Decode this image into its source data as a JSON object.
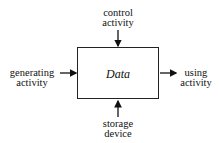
{
  "diagram": {
    "box_label": "Data",
    "inputs": {
      "top": [
        "control",
        "activity"
      ],
      "left": [
        "generating",
        "activity"
      ],
      "right": [
        "using",
        "activity"
      ],
      "bottom": [
        "storage",
        "device"
      ]
    }
  }
}
